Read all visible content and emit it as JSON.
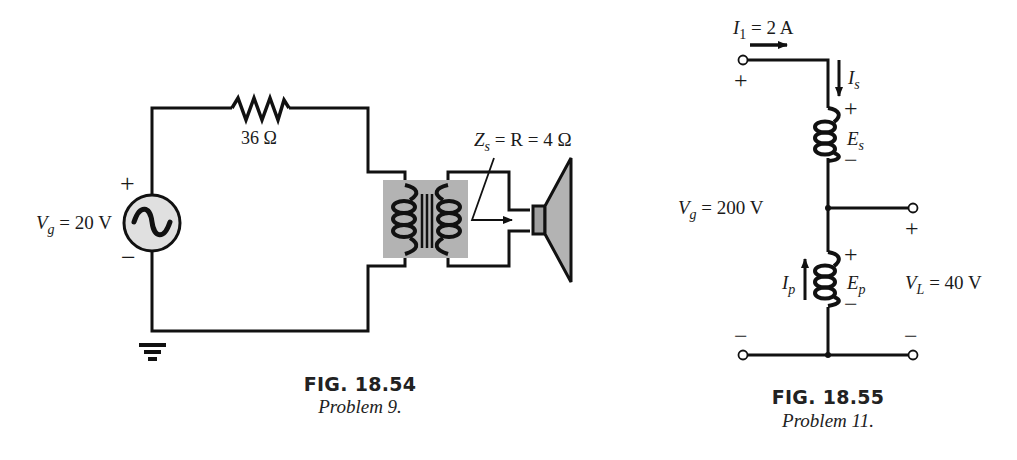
{
  "figures": [
    {
      "id": "fig-18-54",
      "label": "FIG. 18.54",
      "caption": "Problem 9.",
      "source": {
        "symbol": "V",
        "subscript": "g",
        "value": " = 20 V",
        "plus": "+",
        "minus": "−"
      },
      "resistor": {
        "value": "36 Ω"
      },
      "load": {
        "z_symbol": "Z",
        "z_subscript": "s",
        "expr": " = R = 4 Ω"
      },
      "components": [
        "ac-voltage-source",
        "resistor",
        "iron-core-transformer",
        "speaker",
        "ground"
      ]
    },
    {
      "id": "fig-18-55",
      "label": "FIG. 18.55",
      "caption": "Problem 11.",
      "input_current": {
        "symbol": "I",
        "subscript": "1",
        "value": " = 2 A"
      },
      "source_voltage": {
        "symbol": "V",
        "subscript": "g",
        "value": " = 200 V"
      },
      "load_voltage": {
        "symbol": "V",
        "subscript": "L",
        "value": " = 40 V"
      },
      "series_coil": {
        "current_symbol": "I",
        "current_subscript": "s",
        "emf_symbol": "E",
        "emf_subscript": "s"
      },
      "common_coil": {
        "current_symbol": "I",
        "current_subscript": "p",
        "emf_symbol": "E",
        "emf_subscript": "p"
      },
      "polarity": {
        "plus": "+",
        "minus": "−"
      },
      "components": [
        "autotransformer",
        "input-terminals",
        "output-terminals"
      ]
    }
  ],
  "colors": {
    "wire": "#111111",
    "gray_fill": "#b3b3b3",
    "source_fill": "#e0e0e0",
    "text": "#1a1a1a"
  }
}
